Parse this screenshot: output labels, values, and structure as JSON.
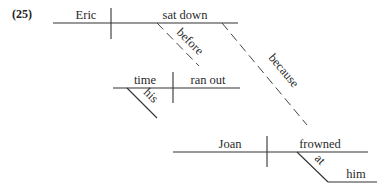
{
  "example_number": "(25)",
  "main_clause": {
    "subject": "Eric",
    "verb": "sat down",
    "connector_before": "before",
    "connector_because": "because"
  },
  "before_clause": {
    "subject": "time",
    "subject_modifier": "his",
    "verb": "ran out"
  },
  "because_clause": {
    "subject": "Joan",
    "verb": "frowned",
    "preposition": "at",
    "object_of_preposition": "him"
  },
  "colors": {
    "line": "#333333",
    "text": "#2a2a2a",
    "background": "#ffffff"
  }
}
